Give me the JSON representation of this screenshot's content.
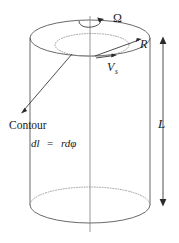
{
  "figure": {
    "background_color": "#ffffff",
    "line_color": "#585858",
    "dotted_line_color": "#8d8d8d",
    "text_color": "#1a1a1a",
    "labels": {
      "omega": "Ω",
      "radius": "R",
      "velocity_symbol": "V",
      "velocity_subscript": "s",
      "length": "L",
      "contour": "Contour",
      "contour_formula_dl": "dl",
      "contour_formula_equals": "=",
      "contour_formula_rdphi": "rdφ"
    },
    "annotations": [
      {
        "name": "rotation-rate",
        "text": "Ω",
        "meaning": "angular rotation rate at top axis"
      },
      {
        "name": "radius",
        "text": "R",
        "meaning": "cylinder radius from axis to rim"
      },
      {
        "name": "surface-velocity",
        "text": "Vs",
        "meaning": "surface velocity tangent vector"
      },
      {
        "name": "length",
        "text": "L",
        "meaning": "cylinder length, double headed arrow at right"
      },
      {
        "name": "contour",
        "text": "Contour",
        "meaning": "pointer to dotted inner circular contour"
      },
      {
        "name": "line-element",
        "text": "dl = rdφ",
        "meaning": "differential line element along contour"
      }
    ],
    "geometry": {
      "cylinder_left_x": 30,
      "cylinder_right_x": 150,
      "top_ellipse_cy": 38,
      "bottom_ellipse_cy": 205,
      "ellipse_rx": 60,
      "ellipse_ry": 18,
      "axis_x": 90,
      "contour_ellipse_rx": 37,
      "contour_ellipse_ry": 11,
      "contour_ellipse_cy": 45
    }
  }
}
